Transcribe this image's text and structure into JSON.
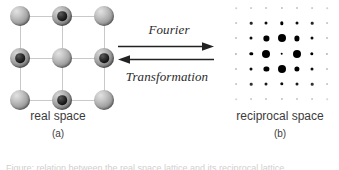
{
  "figure": {
    "background": "#ffffff",
    "width": 339,
    "height": 170
  },
  "real_space": {
    "caption_title": "real space",
    "caption_tag": "(a)",
    "lattice": {
      "type": "square-2d-with-two-atom-basis",
      "rows": 3,
      "cols": 3,
      "cell_line_color": "#c9c9c9",
      "atoms": [
        {
          "row": 0,
          "col": 0,
          "kind": "plain",
          "size": 20
        },
        {
          "row": 0,
          "col": 1,
          "kind": "cored",
          "size": 20
        },
        {
          "row": 0,
          "col": 2,
          "kind": "plain",
          "size": 20
        },
        {
          "row": 1,
          "col": 0,
          "kind": "cored",
          "size": 20
        },
        {
          "row": 1,
          "col": 1,
          "kind": "plain",
          "size": 20
        },
        {
          "row": 1,
          "col": 2,
          "kind": "cored",
          "size": 20
        },
        {
          "row": 2,
          "col": 0,
          "kind": "plain",
          "size": 20
        },
        {
          "row": 2,
          "col": 1,
          "kind": "cored",
          "size": 20
        },
        {
          "row": 2,
          "col": 2,
          "kind": "plain",
          "size": 20
        }
      ]
    }
  },
  "transform": {
    "forward_label": "Fourier",
    "reverse_label": "Transformation",
    "arrow_color": "#222222",
    "forward_direction": "right",
    "reverse_direction": "left"
  },
  "reciprocal_space": {
    "caption_title": "reciprocal space",
    "caption_tag": "(b)",
    "lattice": {
      "type": "square-2d-diffraction-spots",
      "rows": 7,
      "cols": 7,
      "spot_color": "#000000",
      "spots": [
        {
          "row": 0,
          "col": 0,
          "size": 1.6,
          "opacity": 0.18
        },
        {
          "row": 0,
          "col": 1,
          "size": 1.8,
          "opacity": 0.2
        },
        {
          "row": 0,
          "col": 2,
          "size": 2.0,
          "opacity": 0.24
        },
        {
          "row": 0,
          "col": 3,
          "size": 2.2,
          "opacity": 0.26
        },
        {
          "row": 0,
          "col": 4,
          "size": 2.0,
          "opacity": 0.24
        },
        {
          "row": 0,
          "col": 5,
          "size": 1.8,
          "opacity": 0.2
        },
        {
          "row": 0,
          "col": 6,
          "size": 1.6,
          "opacity": 0.18
        },
        {
          "row": 1,
          "col": 0,
          "size": 1.8,
          "opacity": 0.22
        },
        {
          "row": 1,
          "col": 1,
          "size": 2.6,
          "opacity": 0.85
        },
        {
          "row": 1,
          "col": 2,
          "size": 3.0,
          "opacity": 0.95
        },
        {
          "row": 1,
          "col": 3,
          "size": 3.4,
          "opacity": 1.0
        },
        {
          "row": 1,
          "col": 4,
          "size": 3.0,
          "opacity": 0.95
        },
        {
          "row": 1,
          "col": 5,
          "size": 2.6,
          "opacity": 0.85
        },
        {
          "row": 1,
          "col": 6,
          "size": 1.8,
          "opacity": 0.22
        },
        {
          "row": 2,
          "col": 0,
          "size": 2.0,
          "opacity": 0.26
        },
        {
          "row": 2,
          "col": 1,
          "size": 3.0,
          "opacity": 0.95
        },
        {
          "row": 2,
          "col": 2,
          "size": 5.2,
          "opacity": 1.0
        },
        {
          "row": 2,
          "col": 3,
          "size": 8.0,
          "opacity": 1.0
        },
        {
          "row": 2,
          "col": 4,
          "size": 5.2,
          "opacity": 1.0
        },
        {
          "row": 2,
          "col": 5,
          "size": 3.0,
          "opacity": 0.95
        },
        {
          "row": 2,
          "col": 6,
          "size": 2.0,
          "opacity": 0.26
        },
        {
          "row": 3,
          "col": 0,
          "size": 2.2,
          "opacity": 0.3
        },
        {
          "row": 3,
          "col": 1,
          "size": 3.4,
          "opacity": 1.0
        },
        {
          "row": 3,
          "col": 2,
          "size": 8.0,
          "opacity": 1.0
        },
        {
          "row": 3,
          "col": 3,
          "size": 2.6,
          "opacity": 1.0
        },
        {
          "row": 3,
          "col": 4,
          "size": 8.0,
          "opacity": 1.0
        },
        {
          "row": 3,
          "col": 5,
          "size": 3.4,
          "opacity": 1.0
        },
        {
          "row": 3,
          "col": 6,
          "size": 2.2,
          "opacity": 0.3
        },
        {
          "row": 4,
          "col": 0,
          "size": 2.0,
          "opacity": 0.26
        },
        {
          "row": 4,
          "col": 1,
          "size": 3.0,
          "opacity": 0.95
        },
        {
          "row": 4,
          "col": 2,
          "size": 5.2,
          "opacity": 1.0
        },
        {
          "row": 4,
          "col": 3,
          "size": 8.0,
          "opacity": 1.0
        },
        {
          "row": 4,
          "col": 4,
          "size": 5.2,
          "opacity": 1.0
        },
        {
          "row": 4,
          "col": 5,
          "size": 3.0,
          "opacity": 0.95
        },
        {
          "row": 4,
          "col": 6,
          "size": 2.0,
          "opacity": 0.26
        },
        {
          "row": 5,
          "col": 0,
          "size": 1.8,
          "opacity": 0.22
        },
        {
          "row": 5,
          "col": 1,
          "size": 2.6,
          "opacity": 0.8
        },
        {
          "row": 5,
          "col": 2,
          "size": 3.0,
          "opacity": 0.9
        },
        {
          "row": 5,
          "col": 3,
          "size": 3.4,
          "opacity": 0.95
        },
        {
          "row": 5,
          "col": 4,
          "size": 3.0,
          "opacity": 0.9
        },
        {
          "row": 5,
          "col": 5,
          "size": 2.6,
          "opacity": 0.8
        },
        {
          "row": 5,
          "col": 6,
          "size": 1.8,
          "opacity": 0.22
        },
        {
          "row": 6,
          "col": 0,
          "size": 1.6,
          "opacity": 0.16
        },
        {
          "row": 6,
          "col": 1,
          "size": 1.8,
          "opacity": 0.2
        },
        {
          "row": 6,
          "col": 2,
          "size": 2.0,
          "opacity": 0.24
        },
        {
          "row": 6,
          "col": 3,
          "size": 2.2,
          "opacity": 0.26
        },
        {
          "row": 6,
          "col": 4,
          "size": 2.0,
          "opacity": 0.24
        },
        {
          "row": 6,
          "col": 5,
          "size": 1.8,
          "opacity": 0.2
        },
        {
          "row": 6,
          "col": 6,
          "size": 1.6,
          "opacity": 0.16
        }
      ]
    }
  },
  "clipped_caption": "Figure: relation between the real space lattice and its reciprocal lattice"
}
